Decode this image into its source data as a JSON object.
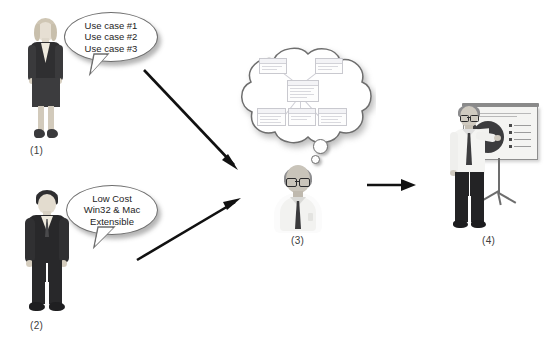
{
  "figure": {
    "background_color": "#ffffff",
    "line_color": "#111111"
  },
  "actors": [
    {
      "id": "actor-1",
      "label": "(1)",
      "role": "businesswoman-standing",
      "description": "Woman in dark business suit and skirt"
    },
    {
      "id": "actor-2",
      "label": "(2)",
      "role": "businessman-standing",
      "description": "Man in dark suit with tie"
    },
    {
      "id": "actor-3",
      "label": "(3)",
      "role": "architect-thinking",
      "description": "Man with glasses, white shirt and tie, thought cloud above"
    },
    {
      "id": "actor-4",
      "label": "(4)",
      "role": "presenter-with-screen",
      "description": "Man presenting a pie chart on a projection screen"
    }
  ],
  "callouts": [
    {
      "id": "callout-requirements",
      "owner": "(1)",
      "type": "speech-bubble",
      "lines": [
        "Use case #1",
        "Use case #2",
        "Use case #3"
      ],
      "text": "Use case #1\nUse case #2\nUse case #3"
    },
    {
      "id": "callout-constraints",
      "owner": "(2)",
      "type": "speech-bubble",
      "lines": [
        "Low Cost",
        "Win32 & Mac",
        "Extensible"
      ],
      "text": "Low Cost\nWin32 & Mac\nExtensible"
    }
  ],
  "thought_cloud": {
    "id": "thought-cloud-design",
    "owner": "(3)",
    "type": "thought-cloud",
    "contents": "faint UML class diagram sketch",
    "dot_count": 2
  },
  "arrows": [
    {
      "id": "arrow-1-to-3",
      "from": "(1)",
      "to": "(3)",
      "direction": "down-right"
    },
    {
      "id": "arrow-2-to-3",
      "from": "(2)",
      "to": "(3)",
      "direction": "up-right"
    },
    {
      "id": "arrow-3-to-4",
      "from": "(3)",
      "to": "(4)",
      "direction": "right"
    }
  ],
  "presentation": {
    "chart_type": "pie",
    "exploded_slice": true,
    "legend_entries": 4
  }
}
